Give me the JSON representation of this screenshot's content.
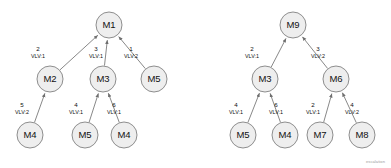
{
  "diagram": {
    "background_color": "#ffffff",
    "node_fill": "#eeeeee",
    "node_stroke": "#8e8e8e",
    "edge_stroke": "#7a7a7a",
    "text_color": "#111111",
    "corner_note": "escalation",
    "arrow_direction": "child-to-parent",
    "trees": [
      {
        "name": "left-tree",
        "root": "M1",
        "nodes": [
          {
            "id": "L-M1",
            "label": "M1",
            "cx": 109,
            "cy": 25,
            "r": 13
          },
          {
            "id": "L-M2",
            "label": "M2",
            "cx": 50,
            "cy": 79,
            "r": 13
          },
          {
            "id": "L-M3",
            "label": "M3",
            "cx": 103,
            "cy": 79,
            "r": 13
          },
          {
            "id": "L-M5a",
            "label": "M5",
            "cx": 154,
            "cy": 79,
            "r": 13
          },
          {
            "id": "L-M4a",
            "label": "M4",
            "cx": 30,
            "cy": 135,
            "r": 13
          },
          {
            "id": "L-M5b",
            "label": "M5",
            "cx": 85,
            "cy": 135,
            "r": 13
          },
          {
            "id": "L-M4b",
            "label": "M4",
            "cx": 124,
            "cy": 135,
            "r": 13
          }
        ],
        "edges": [
          {
            "from": "L-M2",
            "to": "L-M1",
            "weight": "2",
            "vlv": "VLV:1",
            "lx": 38,
            "ly": 51
          },
          {
            "from": "L-M3",
            "to": "L-M1",
            "weight": "3",
            "vlv": "VLV:1",
            "lx": 96,
            "ly": 51
          },
          {
            "from": "L-M5a",
            "to": "L-M1",
            "weight": "1",
            "vlv": "VLV:2",
            "lx": 131,
            "ly": 51
          },
          {
            "from": "L-M4a",
            "to": "L-M2",
            "weight": "5",
            "vlv": "VLV:2",
            "lx": 22,
            "ly": 107
          },
          {
            "from": "L-M5b",
            "to": "L-M3",
            "weight": "4",
            "vlv": "VLV:1",
            "lx": 76,
            "ly": 107
          },
          {
            "from": "L-M4b",
            "to": "L-M3",
            "weight": "6",
            "vlv": "VLV:1",
            "lx": 114,
            "ly": 107
          }
        ]
      },
      {
        "name": "right-tree",
        "root": "M9",
        "nodes": [
          {
            "id": "R-M9",
            "label": "M9",
            "cx": 293,
            "cy": 25,
            "r": 13
          },
          {
            "id": "R-M3",
            "label": "M3",
            "cx": 265,
            "cy": 79,
            "r": 13
          },
          {
            "id": "R-M6",
            "label": "M6",
            "cx": 336,
            "cy": 79,
            "r": 13
          },
          {
            "id": "R-M5",
            "label": "M5",
            "cx": 243,
            "cy": 135,
            "r": 13
          },
          {
            "id": "R-M4",
            "label": "M4",
            "cx": 285,
            "cy": 135,
            "r": 13
          },
          {
            "id": "R-M7",
            "label": "M7",
            "cx": 320,
            "cy": 135,
            "r": 13
          },
          {
            "id": "R-M8",
            "label": "M8",
            "cx": 362,
            "cy": 135,
            "r": 13
          }
        ],
        "edges": [
          {
            "from": "R-M3",
            "to": "R-M9",
            "weight": "2",
            "vlv": "VLV:1",
            "lx": 252,
            "ly": 51
          },
          {
            "from": "R-M6",
            "to": "R-M9",
            "weight": "3",
            "vlv": "VLV:2",
            "lx": 318,
            "ly": 51
          },
          {
            "from": "R-M5",
            "to": "R-M3",
            "weight": "4",
            "vlv": "VLV:1",
            "lx": 236,
            "ly": 107
          },
          {
            "from": "R-M4",
            "to": "R-M3",
            "weight": "6",
            "vlv": "VLV:1",
            "lx": 276,
            "ly": 107
          },
          {
            "from": "R-M7",
            "to": "R-M6",
            "weight": "2",
            "vlv": "VLV:1",
            "lx": 313,
            "ly": 107
          },
          {
            "from": "R-M8",
            "to": "R-M6",
            "weight": "4",
            "vlv": "VLV:2",
            "lx": 352,
            "ly": 107
          }
        ]
      }
    ]
  }
}
